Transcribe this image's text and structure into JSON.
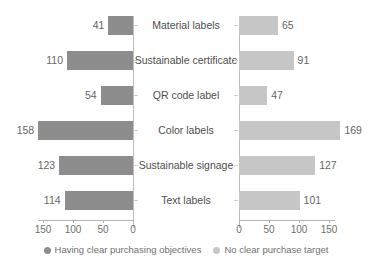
{
  "chart_data": {
    "type": "bar",
    "orientation": "horizontal-diverging",
    "title": "",
    "subtitle": "",
    "xlabel": "",
    "ylabel": "",
    "grid": false,
    "legend_position": "bottom",
    "categories": [
      "Material labels",
      "Sustainable certificate",
      "QR code label",
      "Color labels",
      "Sustainable signage",
      "Text labels"
    ],
    "series": [
      {
        "name": "Having clear purchasing objectives",
        "side": "left",
        "color": "#8d8d8d",
        "values": [
          41,
          110,
          54,
          158,
          123,
          114
        ]
      },
      {
        "name": "No clear purchase target",
        "side": "right",
        "color": "#c6c6c6",
        "values": [
          65,
          91,
          47,
          169,
          127,
          101
        ]
      }
    ],
    "axis_left": {
      "ticks": [
        150,
        100,
        50,
        0
      ],
      "tick_labels": [
        "150",
        "100",
        "50",
        "0"
      ],
      "range": [
        0,
        160
      ],
      "direction": "reversed"
    },
    "axis_right": {
      "ticks": [
        0,
        50,
        100,
        150
      ],
      "tick_labels": [
        "0",
        "50",
        "100",
        "150"
      ],
      "range": [
        0,
        160
      ],
      "direction": "normal"
    },
    "value_labels": {
      "left": [
        "41",
        "110",
        "54",
        "158",
        "123",
        "114"
      ],
      "right": [
        "65",
        "91",
        "47",
        "169",
        "127",
        "101"
      ]
    }
  },
  "legend": {
    "items": [
      {
        "label": "Having clear purchasing objectives",
        "color": "#8d8d8d",
        "marker": "circle-marker"
      },
      {
        "label": "No clear purchase target",
        "color": "#c6c6c6",
        "marker": "circle-marker"
      }
    ]
  },
  "colors": {
    "series_left": "#8d8d8d",
    "series_right": "#c6c6c6",
    "axis": "#b5b5b5",
    "text": "#5a5a5a",
    "background": "#ffffff"
  }
}
